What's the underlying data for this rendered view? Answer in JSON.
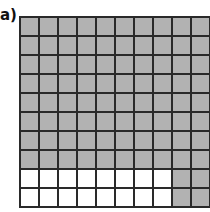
{
  "label": "a)",
  "grid": {
    "rows": 10,
    "cols": 10,
    "shaded_color": "#b2b2b2",
    "unshaded_color": "#ffffff",
    "line_color": "#2a2a2a",
    "shaded_count": 84,
    "unshaded_count": 16,
    "cells": [
      [
        1,
        1,
        1,
        1,
        1,
        1,
        1,
        1,
        1,
        1
      ],
      [
        1,
        1,
        1,
        1,
        1,
        1,
        1,
        1,
        1,
        1
      ],
      [
        1,
        1,
        1,
        1,
        1,
        1,
        1,
        1,
        1,
        1
      ],
      [
        1,
        1,
        1,
        1,
        1,
        1,
        1,
        1,
        1,
        1
      ],
      [
        1,
        1,
        1,
        1,
        1,
        1,
        1,
        1,
        1,
        1
      ],
      [
        1,
        1,
        1,
        1,
        1,
        1,
        1,
        1,
        1,
        1
      ],
      [
        1,
        1,
        1,
        1,
        1,
        1,
        1,
        1,
        1,
        1
      ],
      [
        1,
        1,
        1,
        1,
        1,
        1,
        1,
        1,
        1,
        1
      ],
      [
        0,
        0,
        0,
        0,
        0,
        0,
        0,
        0,
        1,
        1
      ],
      [
        0,
        0,
        0,
        0,
        0,
        0,
        0,
        0,
        1,
        1
      ]
    ]
  }
}
